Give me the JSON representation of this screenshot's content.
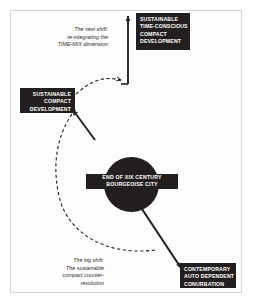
{
  "diagram": {
    "background_color": "#ffffff",
    "frame_color": "#d2d2d2",
    "node_fill": "#231f20",
    "node_text_color": "#ffffff",
    "annotation_color": "#2b2b2b",
    "nodes": {
      "origin_circle": {
        "label_lines": [
          "END OF XIX CENTURY",
          "BOURGEOISE CITY"
        ],
        "shape": "circle"
      },
      "contemporary_auto": {
        "label_lines": [
          "CONTEMPORARY",
          "AUTO DEPENDENT",
          "CONURBATION"
        ],
        "shape": "box"
      },
      "sustainable_compact": {
        "label_lines": [
          "SUSTAINABLE",
          "COMPACT",
          "DEVELOPMENT"
        ],
        "shape": "box"
      },
      "sustainable_time_conscious": {
        "label_lines": [
          "SUSTAINABLE",
          "TIME-CONSCIOUS",
          "COMPACT",
          "DEVELOPMENT"
        ],
        "shape": "box"
      }
    },
    "annotations": {
      "next_shift": {
        "lines": [
          "The next shift:",
          "re-integrating the",
          "TIME-MIX dimension"
        ]
      },
      "big_shift": {
        "lines": [
          "The big shift:",
          "The sustainable",
          "compact counter-",
          "revolution"
        ]
      }
    },
    "connectors": [
      {
        "name": "origin-to-contemporary",
        "style": "solid",
        "from": "origin_circle",
        "to": "contemporary_auto"
      },
      {
        "name": "contemporary-to-sustainable-compact-arc",
        "style": "dashed",
        "from": "contemporary_auto",
        "to": "sustainable_compact"
      },
      {
        "name": "arc-to-sustainable-compact",
        "style": "solid",
        "from": "arc",
        "to": "sustainable_compact"
      },
      {
        "name": "sustainable-compact-to-time-conscious",
        "style": "dashed",
        "from": "sustainable_compact",
        "to": "sustainable_time_conscious"
      },
      {
        "name": "up-to-time-conscious",
        "style": "solid",
        "from": "junction",
        "to": "sustainable_time_conscious"
      }
    ]
  }
}
